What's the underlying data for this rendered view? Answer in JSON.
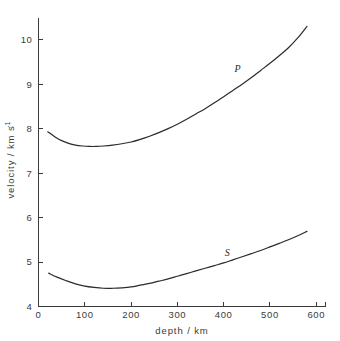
{
  "chart_data": {
    "type": "line",
    "title": "",
    "xlabel": "depth / km",
    "ylabel": "velocity / km s⁻¹",
    "ylabel_main": "velocity / km s",
    "ylabel_exponent": "-1",
    "xlim": [
      0,
      620
    ],
    "ylim": [
      4,
      10.5
    ],
    "xticks": [
      0,
      100,
      200,
      300,
      400,
      500,
      600
    ],
    "xtick_labels": [
      "0",
      "100",
      "200",
      "300",
      "400",
      "500",
      "600"
    ],
    "yticks": [
      4,
      5,
      6,
      7,
      8,
      9,
      10
    ],
    "ytick_labels": [
      "4",
      "5",
      "6",
      "7",
      "8",
      "9",
      "10"
    ],
    "grid": false,
    "legend": "inline-curve-labels",
    "series": [
      {
        "name": "P",
        "label": "P",
        "label_x": 430,
        "label_y": 9.28,
        "x": [
          20,
          35,
          50,
          65,
          80,
          95,
          110,
          125,
          140,
          160,
          180,
          200,
          220,
          240,
          260,
          280,
          300,
          320,
          340,
          360,
          380,
          400,
          420,
          440,
          460,
          480,
          500,
          520,
          540,
          560,
          580
        ],
        "y": [
          7.93,
          7.82,
          7.73,
          7.67,
          7.63,
          7.61,
          7.6,
          7.6,
          7.61,
          7.63,
          7.66,
          7.7,
          7.76,
          7.83,
          7.91,
          8.0,
          8.1,
          8.21,
          8.33,
          8.45,
          8.58,
          8.72,
          8.86,
          9.0,
          9.15,
          9.31,
          9.47,
          9.64,
          9.82,
          10.04,
          10.3
        ]
      },
      {
        "name": "S",
        "label": "S",
        "label_x": 408,
        "label_y": 5.14,
        "x": [
          22,
          40,
          60,
          80,
          100,
          120,
          140,
          160,
          180,
          200,
          220,
          240,
          260,
          280,
          300,
          320,
          340,
          360,
          380,
          400,
          420,
          440,
          460,
          480,
          500,
          520,
          540,
          560,
          580
        ],
        "y": [
          4.75,
          4.66,
          4.58,
          4.51,
          4.46,
          4.43,
          4.41,
          4.41,
          4.42,
          4.44,
          4.48,
          4.52,
          4.57,
          4.62,
          4.68,
          4.74,
          4.8,
          4.86,
          4.92,
          4.98,
          5.05,
          5.12,
          5.19,
          5.26,
          5.34,
          5.42,
          5.5,
          5.59,
          5.69
        ]
      }
    ]
  }
}
